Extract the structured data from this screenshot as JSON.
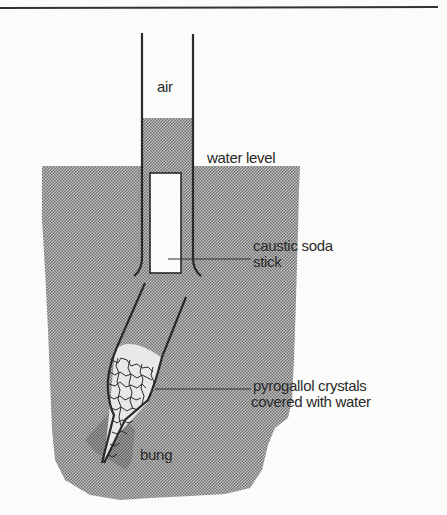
{
  "figure": {
    "labels": {
      "air": "air",
      "water_level": "water level",
      "caustic_soda_line1": "caustic soda",
      "caustic_soda_line2": "stick",
      "pyrogallol_line1": "pyrogallol crystals",
      "pyrogallol_line2": "covered with water",
      "bung": "bung"
    },
    "colors": {
      "background": "#fbfbf9",
      "water_fill": "#9a9a9a",
      "line": "#2a2a2a",
      "bung_fill": "#858585"
    }
  }
}
